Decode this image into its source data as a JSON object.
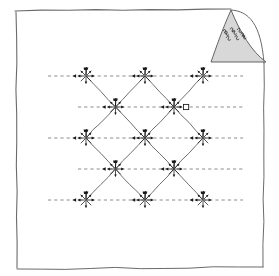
{
  "page": {
    "background_color": "#ffffff",
    "sheet": {
      "label": "paper-sheet",
      "fill": "#ffffff",
      "border_color": "#6b6b6b",
      "left": 15,
      "top": 9,
      "right": 266,
      "bottom": 270
    },
    "corner_fold": {
      "label": "page-curl",
      "fill": "#c9c9c9",
      "stroke": "#555555",
      "annotation_text": "",
      "annotation_note": "illegible handwritten scribble"
    }
  },
  "diagram": {
    "title": "",
    "stroke_color": "#555555",
    "dash_color": "#6e6e6e",
    "node_color": "#1a1a1a",
    "geometry": {
      "col_x": [
        86,
        145,
        203
      ],
      "mid_x": [
        115.5,
        174
      ],
      "row_y": [
        76,
        107,
        138,
        169,
        200
      ],
      "dash_x_start": 48,
      "dash_x_end": 243,
      "node_radius": 7
    },
    "rows": [
      {
        "index": 1,
        "y": 76,
        "kind": "major",
        "nodes": [
          {
            "id": "n-r1-c1",
            "x": 86,
            "y": 76,
            "star": true,
            "marker": "none"
          },
          {
            "id": "n-r1-c2",
            "x": 145,
            "y": 76,
            "star": true,
            "marker": "none"
          },
          {
            "id": "n-r1-c3",
            "x": 203,
            "y": 76,
            "star": true,
            "marker": "none"
          }
        ]
      },
      {
        "index": 2,
        "y": 107,
        "kind": "minor",
        "nodes": [
          {
            "id": "n-r2-c1",
            "x": 115.5,
            "y": 107,
            "star": true,
            "marker": "none"
          },
          {
            "id": "n-r2-c2",
            "x": 174,
            "y": 107,
            "star": true,
            "marker": "open-square"
          }
        ]
      },
      {
        "index": 3,
        "y": 138,
        "kind": "major",
        "nodes": [
          {
            "id": "n-r3-c1",
            "x": 86,
            "y": 138,
            "star": true,
            "marker": "none"
          },
          {
            "id": "n-r3-c2",
            "x": 145,
            "y": 138,
            "star": true,
            "marker": "none"
          },
          {
            "id": "n-r3-c3",
            "x": 203,
            "y": 138,
            "star": true,
            "marker": "none"
          }
        ]
      },
      {
        "index": 4,
        "y": 169,
        "kind": "minor",
        "nodes": [
          {
            "id": "n-r4-c1",
            "x": 115.5,
            "y": 169,
            "star": true,
            "marker": "none"
          },
          {
            "id": "n-r4-c2",
            "x": 174,
            "y": 169,
            "star": true,
            "marker": "none"
          }
        ]
      },
      {
        "index": 5,
        "y": 200,
        "kind": "major",
        "nodes": [
          {
            "id": "n-r5-c1",
            "x": 86,
            "y": 200,
            "star": true,
            "marker": "none"
          },
          {
            "id": "n-r5-c2",
            "x": 145,
            "y": 200,
            "star": true,
            "marker": "none"
          },
          {
            "id": "n-r5-c3",
            "x": 203,
            "y": 200,
            "star": true,
            "marker": "none"
          }
        ]
      }
    ],
    "dashed_lines": [
      {
        "id": "dash-1",
        "y": 76,
        "x1": 48,
        "x2": 243
      },
      {
        "id": "dash-2",
        "y": 107,
        "x1": 78,
        "x2": 243
      },
      {
        "id": "dash-3",
        "y": 138,
        "x1": 48,
        "x2": 243
      },
      {
        "id": "dash-4",
        "y": 169,
        "x1": 78,
        "x2": 243
      },
      {
        "id": "dash-5",
        "y": 200,
        "x1": 48,
        "x2": 243
      }
    ],
    "lattice_edges": [
      {
        "x1": 86,
        "y1": 76,
        "x2": 115.5,
        "y2": 107
      },
      {
        "x1": 145,
        "y1": 76,
        "x2": 115.5,
        "y2": 107
      },
      {
        "x1": 145,
        "y1": 76,
        "x2": 174,
        "y2": 107
      },
      {
        "x1": 203,
        "y1": 76,
        "x2": 174,
        "y2": 107
      },
      {
        "x1": 115.5,
        "y1": 107,
        "x2": 86,
        "y2": 138
      },
      {
        "x1": 115.5,
        "y1": 107,
        "x2": 145,
        "y2": 138
      },
      {
        "x1": 174,
        "y1": 107,
        "x2": 145,
        "y2": 138
      },
      {
        "x1": 174,
        "y1": 107,
        "x2": 203,
        "y2": 138
      },
      {
        "x1": 86,
        "y1": 138,
        "x2": 115.5,
        "y2": 169
      },
      {
        "x1": 145,
        "y1": 138,
        "x2": 115.5,
        "y2": 169
      },
      {
        "x1": 145,
        "y1": 138,
        "x2": 174,
        "y2": 169
      },
      {
        "x1": 203,
        "y1": 138,
        "x2": 174,
        "y2": 169
      },
      {
        "x1": 115.5,
        "y1": 169,
        "x2": 86,
        "y2": 200
      },
      {
        "x1": 115.5,
        "y1": 169,
        "x2": 145,
        "y2": 200
      },
      {
        "x1": 174,
        "y1": 169,
        "x2": 145,
        "y2": 200
      },
      {
        "x1": 174,
        "y1": 169,
        "x2": 203,
        "y2": 200
      }
    ]
  }
}
